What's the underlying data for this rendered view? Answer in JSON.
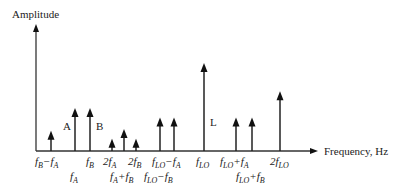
{
  "chart_data": {
    "type": "bar",
    "title": "",
    "ylabel": "Amplitude",
    "xlabel": "Frequency, Hz",
    "ylim": [
      0,
      1
    ],
    "spectral_lines": [
      {
        "name": "fB-fA",
        "label_main": "f",
        "label_sub": "B",
        "label_suffix": "−f",
        "label_sub2": "A",
        "amplitude": 0.23,
        "row": 1
      },
      {
        "name": "fA",
        "label_main": "f",
        "label_sub": "A",
        "amplitude": 0.49,
        "row": 2,
        "tag": "A"
      },
      {
        "name": "fB",
        "label_main": "f",
        "label_sub": "B",
        "amplitude": 0.49,
        "row": 1,
        "tag": "B"
      },
      {
        "name": "2fA",
        "label_main": "2f",
        "label_sub": "A",
        "amplitude": 0.14,
        "row": 1
      },
      {
        "name": "fA+fB",
        "label_main": "f",
        "label_sub": "A",
        "label_suffix": "+f",
        "label_sub2": "B",
        "amplitude": 0.25,
        "row": 2
      },
      {
        "name": "2fB",
        "label_main": "2f",
        "label_sub": "B",
        "amplitude": 0.14,
        "row": 1
      },
      {
        "name": "fLO-fB",
        "label_main": "f",
        "label_sub": "LO",
        "label_suffix": "−f",
        "label_sub2": "B",
        "amplitude": 0.38,
        "row": 2
      },
      {
        "name": "fLO-fA",
        "label_main": "f",
        "label_sub": "LO",
        "label_suffix": "−f",
        "label_sub2": "A",
        "amplitude": 0.38,
        "row": 1
      },
      {
        "name": "fLO",
        "label_main": "f",
        "label_sub": "LO",
        "amplitude": 1.0,
        "row": 1,
        "tag": "L"
      },
      {
        "name": "fLO+fA",
        "label_main": "f",
        "label_sub": "LO",
        "label_suffix": "+f",
        "label_sub2": "A",
        "amplitude": 0.38,
        "row": 1
      },
      {
        "name": "fLO+fB",
        "label_main": "f",
        "label_sub": "LO",
        "label_suffix": "+f",
        "label_sub2": "B",
        "amplitude": 0.38,
        "row": 2
      },
      {
        "name": "2fLO",
        "label_main": "2f",
        "label_sub": "LO",
        "amplitude": 0.68,
        "row": 1
      }
    ],
    "grid": false,
    "legend": "none"
  }
}
